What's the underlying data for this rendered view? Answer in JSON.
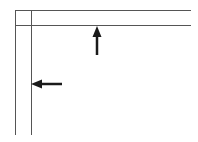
{
  "diagram": {
    "background": "#ffffff",
    "line_color": "#555555",
    "arrow_color": "#1a1a1a",
    "lines": [
      {
        "name": "outer-vertical-line",
        "x1": 15.5,
        "y1": 10,
        "x2": 15.5,
        "y2": 135
      },
      {
        "name": "inner-vertical-line",
        "x1": 31.5,
        "y1": 10,
        "x2": 31.5,
        "y2": 135
      },
      {
        "name": "outer-horizontal-line",
        "x1": 15.5,
        "y1": 10.5,
        "x2": 191,
        "y2": 10.5
      },
      {
        "name": "inner-horizontal-line",
        "x1": 15.5,
        "y1": 25.5,
        "x2": 191,
        "y2": 25.5
      }
    ],
    "arrows": [
      {
        "name": "up-arrow-icon",
        "direction": "up",
        "tip_x": 97,
        "tip_y": 26,
        "tail_x": 97,
        "tail_y": 55
      },
      {
        "name": "left-arrow-icon",
        "direction": "left",
        "tip_x": 31,
        "tip_y": 84,
        "tail_x": 62,
        "tail_y": 84
      }
    ]
  }
}
